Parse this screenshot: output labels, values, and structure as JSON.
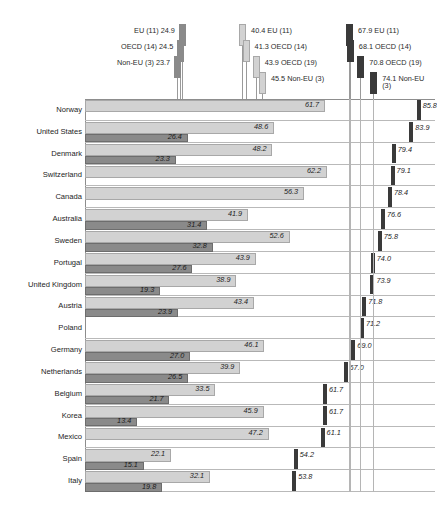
{
  "chart_data": {
    "type": "bar",
    "orientation": "horizontal",
    "title": "",
    "subtitle": "",
    "xlabel": "",
    "ylabel": "",
    "xlim": [
      0,
      90
    ],
    "grid": false,
    "legend_position": "top",
    "categories": [
      "Norway",
      "United States",
      "Denmark",
      "Switzerland",
      "Canada",
      "Australia",
      "Sweden",
      "Portugal",
      "United Kingdom",
      "Austria",
      "Poland",
      "Germany",
      "Netherlands",
      "Belgium",
      "Korea",
      "Mexico",
      "Spain",
      "Italy"
    ],
    "series": [
      {
        "name": "low",
        "style": "dark-gray-bar",
        "color": "#8a8a8a",
        "values": [
          null,
          26.4,
          23.3,
          null,
          null,
          31.4,
          32.8,
          27.6,
          19.3,
          23.9,
          null,
          27.0,
          26.5,
          21.7,
          13.4,
          null,
          15.1,
          19.8
        ]
      },
      {
        "name": "mid",
        "style": "light-gray-bar",
        "color": "#d2d2d2",
        "values": [
          61.7,
          48.6,
          48.2,
          62.2,
          56.3,
          41.9,
          52.6,
          43.9,
          38.9,
          43.4,
          null,
          46.1,
          39.9,
          33.5,
          45.9,
          47.2,
          22.1,
          32.1
        ]
      },
      {
        "name": "high",
        "style": "dark-marker",
        "color": "#3a3a3a",
        "values": [
          85.8,
          83.9,
          79.4,
          79.1,
          78.4,
          76.6,
          75.8,
          74.0,
          73.9,
          71.8,
          71.2,
          69.0,
          67.0,
          61.7,
          61.7,
          61.1,
          54.2,
          53.8
        ]
      }
    ],
    "reference_groups": [
      {
        "group": "low",
        "side": "left",
        "lines": [
          {
            "label": "EU (11) 24.9",
            "value": 24.9,
            "shade": "#8a8a8a"
          },
          {
            "label": "OECD (14) 24.5",
            "value": 24.5,
            "shade": "#8a8a8a"
          },
          {
            "label": "Non-EU (3) 23.7",
            "value": 23.7,
            "shade": "#8a8a8a"
          }
        ]
      },
      {
        "group": "mid",
        "side": "right",
        "lines": [
          {
            "label": "40.4 EU (11)",
            "value": 40.4,
            "shade": "#d2d2d2"
          },
          {
            "label": "41.3 OECD (14)",
            "value": 41.3,
            "shade": "#d2d2d2"
          },
          {
            "label": "43.9 OECD (19)",
            "value": 43.9,
            "shade": "#d2d2d2"
          },
          {
            "label": "45.5 Non-EU (3)",
            "value": 45.5,
            "shade": "#d2d2d2"
          }
        ]
      },
      {
        "group": "high",
        "side": "right",
        "lines": [
          {
            "label": "67.9 EU (11)",
            "value": 67.9,
            "shade": "#3a3a3a"
          },
          {
            "label": "68.1 OECD (14)",
            "value": 68.1,
            "shade": "#3a3a3a"
          },
          {
            "label": "70.8 OECD (19)",
            "value": 70.8,
            "shade": "#3a3a3a"
          },
          {
            "label": "74.1 Non-EU (3)",
            "value": 74.1,
            "shade": "#3a3a3a"
          }
        ]
      }
    ]
  }
}
